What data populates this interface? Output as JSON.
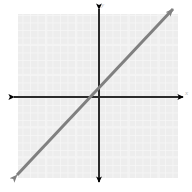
{
  "figure": {
    "width": 192,
    "height": 192,
    "background_color": "#ffffff",
    "title": ""
  },
  "grid_region": {
    "name": "shaded-grid-panel",
    "x": 18,
    "y": 14,
    "width": 160,
    "height": 164,
    "fill_color": "#ededed",
    "grid_line_color": "#f7f7f7",
    "grid_spacing_px": 7.5,
    "grid_visible": true
  },
  "axes": {
    "x_axis": {
      "label": "x",
      "label_color": "#b8b8b8",
      "color": "#000000",
      "stroke_width": 2,
      "y_position": 97,
      "start_x": 10,
      "end_x": 186,
      "arrow_start": true,
      "arrow_end": true
    },
    "y_axis": {
      "label": "y",
      "label_color": "#b8b8b8",
      "color": "#000000",
      "stroke_width": 2,
      "x_position": 99,
      "start_y": 5,
      "end_y": 186,
      "arrow_start": true,
      "arrow_end": true
    },
    "origin": {
      "x": 99,
      "y": 97
    },
    "tick_labels_visible": false
  },
  "chart_data": {
    "type": "line",
    "title": "",
    "xlabel": "x",
    "ylabel": "y",
    "grid": true,
    "legend": null,
    "xlim": [
      -11,
      11
    ],
    "ylim": [
      -11,
      11
    ],
    "series": [
      {
        "name": "y = x",
        "equation": "y = x",
        "slope": 1,
        "y_intercept": 0,
        "color": "#808080",
        "stroke_width": 3,
        "arrow_start": true,
        "arrow_end": true,
        "x": [
          -11,
          11
        ],
        "values": [
          -11,
          11
        ],
        "points": [
          {
            "x": -11,
            "y": -11
          },
          {
            "x": 0,
            "y": 0
          },
          {
            "x": 11,
            "y": 11
          }
        ],
        "screen_endpoints": [
          {
            "x": 14,
            "y": 178
          },
          {
            "x": 176,
            "y": 6
          }
        ]
      }
    ]
  }
}
